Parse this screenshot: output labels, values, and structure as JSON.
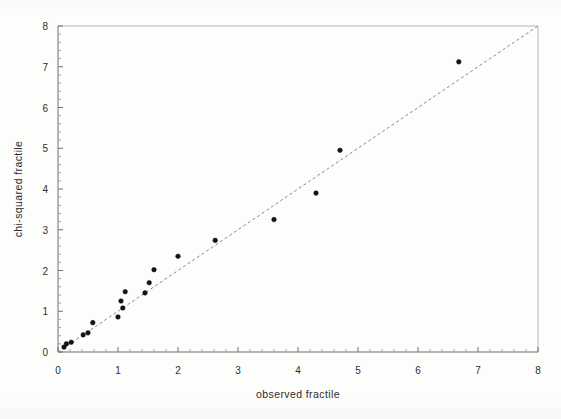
{
  "figure": {
    "background_color": "#fdfdfc",
    "frame_color": "#b9b9b9",
    "axis_color": "#6e6e6e"
  },
  "chart_data": {
    "type": "scatter",
    "title": "",
    "subtitle": "",
    "xlabel": "observed fractile",
    "ylabel": "chi-squared fractile",
    "xlim": [
      0,
      8
    ],
    "ylim": [
      0,
      8
    ],
    "xticks": [
      0,
      1,
      2,
      3,
      4,
      5,
      6,
      7,
      8
    ],
    "yticks": [
      0,
      1,
      2,
      3,
      4,
      5,
      6,
      7,
      8
    ],
    "xtick_labels": [
      "0",
      "1",
      "2",
      "3",
      "4",
      "5",
      "6",
      "7",
      "8"
    ],
    "ytick_labels": [
      "0",
      "1",
      "2",
      "3",
      "4",
      "5",
      "6",
      "7",
      "8"
    ],
    "minor_ticks_per_interval": 4,
    "grid": false,
    "legend": null,
    "legend_position": "none",
    "annotations": [],
    "marker": {
      "shape": "circle",
      "color": "#151515",
      "size_px": 4.6
    },
    "reference_line": {
      "name": "identity-line",
      "style": "dashed",
      "color": "#8089a6",
      "x": [
        0,
        8
      ],
      "y": [
        0,
        8
      ]
    },
    "series": [
      {
        "name": "chi-squared probability plot",
        "points": [
          [
            0.1,
            0.12
          ],
          [
            0.14,
            0.2
          ],
          [
            0.22,
            0.24
          ],
          [
            0.42,
            0.42
          ],
          [
            0.5,
            0.47
          ],
          [
            0.58,
            0.72
          ],
          [
            1.0,
            0.86
          ],
          [
            1.05,
            1.25
          ],
          [
            1.08,
            1.08
          ],
          [
            1.12,
            1.48
          ],
          [
            1.45,
            1.45
          ],
          [
            1.52,
            1.7
          ],
          [
            1.6,
            2.02
          ],
          [
            2.0,
            2.35
          ],
          [
            2.62,
            2.74
          ],
          [
            3.6,
            3.25
          ],
          [
            4.3,
            3.9
          ],
          [
            4.7,
            4.95
          ],
          [
            6.68,
            7.12
          ]
        ]
      }
    ]
  }
}
